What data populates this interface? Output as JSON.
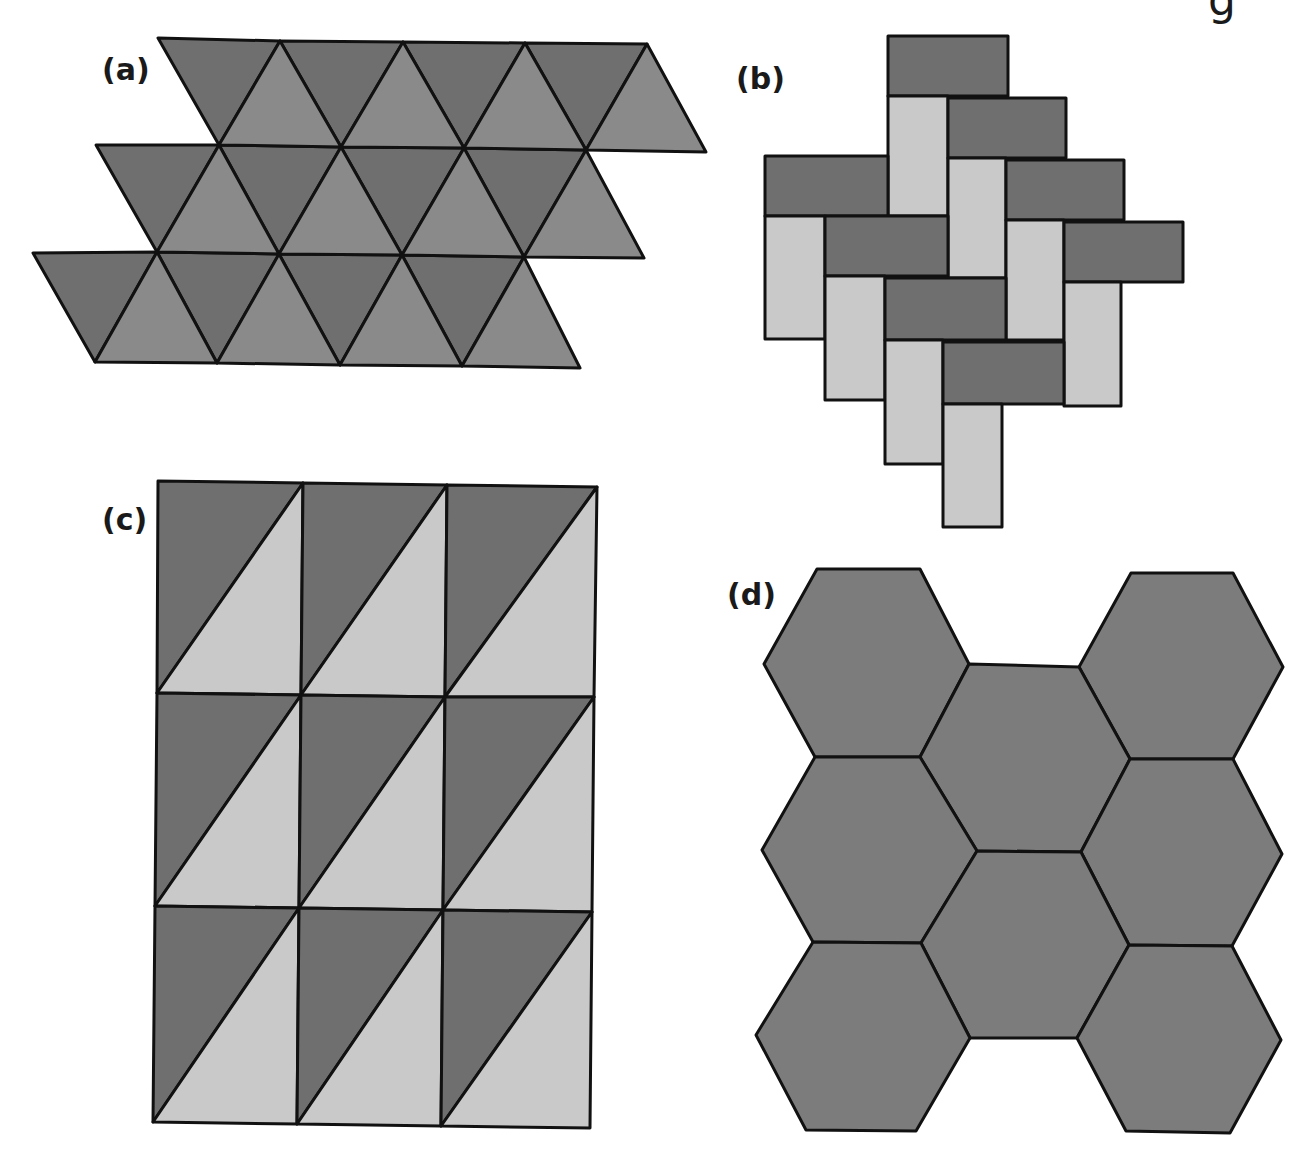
{
  "colors": {
    "dark": "#6f6f6f",
    "medium": "#8a8a8a",
    "light": "#c9c9c9",
    "stroke": "#111111",
    "hex": "#7c7c7c"
  },
  "header_fragment": "g",
  "panels": {
    "a": {
      "label": "(a)",
      "caption": "Tessellation of equilateral triangles",
      "dark_triangles": [
        [
          [
            158,
            38
          ],
          [
            280,
            41
          ],
          [
            219,
            145
          ]
        ],
        [
          [
            280,
            41
          ],
          [
            403,
            42
          ],
          [
            341,
            147
          ]
        ],
        [
          [
            403,
            42
          ],
          [
            525,
            43
          ],
          [
            464,
            148
          ]
        ],
        [
          [
            525,
            43
          ],
          [
            647,
            44
          ],
          [
            586,
            150
          ]
        ],
        [
          [
            96,
            145
          ],
          [
            219,
            145
          ],
          [
            157,
            252
          ]
        ],
        [
          [
            219,
            145
          ],
          [
            341,
            147
          ],
          [
            279,
            254
          ]
        ],
        [
          [
            341,
            147
          ],
          [
            464,
            148
          ],
          [
            402,
            255
          ]
        ],
        [
          [
            464,
            148
          ],
          [
            586,
            150
          ],
          [
            524,
            257
          ]
        ],
        [
          [
            33,
            253
          ],
          [
            157,
            252
          ],
          [
            95,
            362
          ]
        ],
        [
          [
            157,
            252
          ],
          [
            279,
            254
          ],
          [
            217,
            363
          ]
        ],
        [
          [
            279,
            254
          ],
          [
            402,
            255
          ],
          [
            340,
            365
          ]
        ],
        [
          [
            402,
            255
          ],
          [
            524,
            257
          ],
          [
            462,
            366
          ]
        ]
      ],
      "light_triangles": [
        [
          [
            219,
            145
          ],
          [
            280,
            41
          ],
          [
            341,
            147
          ]
        ],
        [
          [
            341,
            147
          ],
          [
            403,
            42
          ],
          [
            464,
            148
          ]
        ],
        [
          [
            464,
            148
          ],
          [
            525,
            43
          ],
          [
            586,
            150
          ]
        ],
        [
          [
            586,
            150
          ],
          [
            647,
            44
          ],
          [
            706,
            152
          ]
        ],
        [
          [
            157,
            252
          ],
          [
            219,
            145
          ],
          [
            279,
            254
          ]
        ],
        [
          [
            279,
            254
          ],
          [
            341,
            147
          ],
          [
            402,
            255
          ]
        ],
        [
          [
            402,
            255
          ],
          [
            464,
            148
          ],
          [
            524,
            257
          ]
        ],
        [
          [
            524,
            257
          ],
          [
            586,
            150
          ],
          [
            644,
            258
          ]
        ],
        [
          [
            95,
            362
          ],
          [
            157,
            252
          ],
          [
            217,
            363
          ]
        ],
        [
          [
            217,
            363
          ],
          [
            279,
            254
          ],
          [
            340,
            365
          ]
        ],
        [
          [
            340,
            365
          ],
          [
            402,
            255
          ],
          [
            462,
            366
          ]
        ],
        [
          [
            462,
            366
          ],
          [
            524,
            257
          ],
          [
            580,
            368
          ]
        ]
      ]
    },
    "b": {
      "label": "(b)",
      "caption": "Herringbone brick tessellation",
      "bricks": [
        {
          "x": 888,
          "y": 36,
          "w": 120,
          "h": 60,
          "tone": "dark"
        },
        {
          "x": 888,
          "y": 96,
          "w": 60,
          "h": 120,
          "tone": "light"
        },
        {
          "x": 948,
          "y": 98,
          "w": 118,
          "h": 60,
          "tone": "dark"
        },
        {
          "x": 765,
          "y": 156,
          "w": 123,
          "h": 60,
          "tone": "dark"
        },
        {
          "x": 948,
          "y": 158,
          "w": 58,
          "h": 120,
          "tone": "light"
        },
        {
          "x": 1006,
          "y": 160,
          "w": 118,
          "h": 60,
          "tone": "dark"
        },
        {
          "x": 765,
          "y": 216,
          "w": 60,
          "h": 123,
          "tone": "light"
        },
        {
          "x": 825,
          "y": 216,
          "w": 123,
          "h": 60,
          "tone": "dark"
        },
        {
          "x": 1006,
          "y": 220,
          "w": 58,
          "h": 120,
          "tone": "light"
        },
        {
          "x": 1064,
          "y": 222,
          "w": 119,
          "h": 60,
          "tone": "dark"
        },
        {
          "x": 825,
          "y": 276,
          "w": 60,
          "h": 124,
          "tone": "light"
        },
        {
          "x": 885,
          "y": 278,
          "w": 121,
          "h": 62,
          "tone": "dark"
        },
        {
          "x": 1064,
          "y": 282,
          "w": 57,
          "h": 124,
          "tone": "light"
        },
        {
          "x": 885,
          "y": 340,
          "w": 58,
          "h": 124,
          "tone": "light"
        },
        {
          "x": 943,
          "y": 342,
          "w": 121,
          "h": 62,
          "tone": "dark"
        },
        {
          "x": 943,
          "y": 404,
          "w": 59,
          "h": 123,
          "tone": "light"
        }
      ]
    },
    "c": {
      "label": "(c)",
      "caption": "Rectangles divided into right triangles",
      "grid": {
        "rows": [
          {
            "y_top": [
              158,
              303,
              447,
              597
            ],
            "y_bottom": [
              693,
              695,
              697,
              697
            ]
          },
          {
            "y_top": [
              693,
              695,
              697,
              697
            ],
            "y_bottom": [
              906,
              908,
              910,
              912
            ]
          },
          {
            "y_top": [
              906,
              908,
              910,
              912
            ],
            "y_bottom": [
              1122,
              1124,
              1126,
              1128
            ]
          }
        ],
        "x_lines_top": [
          [
            158,
            303,
            447,
            597
          ],
          [
            157,
            301,
            445,
            594
          ],
          [
            155,
            299,
            443,
            592
          ]
        ],
        "x_lines_bottom": [
          [
            157,
            301,
            445,
            594
          ],
          [
            155,
            299,
            443,
            592
          ],
          [
            153,
            297,
            441,
            590
          ]
        ],
        "cells": 9
      }
    },
    "d": {
      "label": "(d)",
      "caption": "Tessellation of regular hexagons",
      "hexagons": [
        [
          [
            817,
            569
          ],
          [
            920,
            569
          ],
          [
            969,
            664
          ],
          [
            920,
            757
          ],
          [
            815,
            757
          ],
          [
            764,
            664
          ]
        ],
        [
          [
            1131,
            573
          ],
          [
            1233,
            573
          ],
          [
            1283,
            667
          ],
          [
            1233,
            759
          ],
          [
            1130,
            759
          ],
          [
            1079,
            667
          ]
        ],
        [
          [
            969,
            664
          ],
          [
            1079,
            667
          ],
          [
            1130,
            759
          ],
          [
            1081,
            852
          ],
          [
            977,
            851
          ],
          [
            920,
            757
          ]
        ],
        [
          [
            815,
            757
          ],
          [
            920,
            757
          ],
          [
            977,
            851
          ],
          [
            921,
            943
          ],
          [
            813,
            942
          ],
          [
            762,
            850
          ]
        ],
        [
          [
            1130,
            759
          ],
          [
            1233,
            759
          ],
          [
            1282,
            854
          ],
          [
            1232,
            946
          ],
          [
            1129,
            945
          ],
          [
            1081,
            852
          ]
        ],
        [
          [
            977,
            851
          ],
          [
            1081,
            852
          ],
          [
            1129,
            945
          ],
          [
            1077,
            1038
          ],
          [
            970,
            1038
          ],
          [
            921,
            943
          ]
        ],
        [
          [
            813,
            942
          ],
          [
            921,
            943
          ],
          [
            970,
            1038
          ],
          [
            916,
            1131
          ],
          [
            806,
            1130
          ],
          [
            756,
            1035
          ]
        ],
        [
          [
            1129,
            945
          ],
          [
            1232,
            946
          ],
          [
            1281,
            1040
          ],
          [
            1230,
            1133
          ],
          [
            1126,
            1131
          ],
          [
            1077,
            1038
          ]
        ]
      ]
    }
  }
}
